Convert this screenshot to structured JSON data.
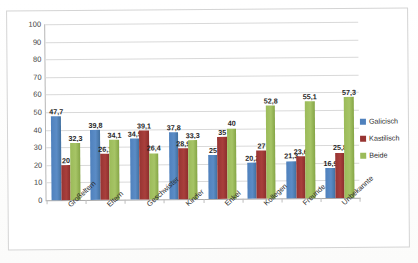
{
  "chart_data": {
    "type": "bar",
    "title": "",
    "subtitle": "",
    "xlabel": "",
    "ylabel": "",
    "ylim": [
      0,
      100
    ],
    "ytick_step": 10,
    "yticks": [
      "100",
      "90",
      "80",
      "70",
      "60",
      "50",
      "40",
      "30",
      "20",
      "10",
      "0"
    ],
    "grid": true,
    "legend_position": "right",
    "categories": [
      "Großeltern",
      "Eltern",
      "Geschwister",
      "Kinder",
      "Enkel",
      "Kollegen",
      "Freunde",
      "Unbekannte"
    ],
    "series": [
      {
        "name": "Galicisch",
        "color": "#4F81BD",
        "values": [
          47.7,
          39.8,
          34.5,
          37.8,
          25,
          20.2,
          21.3,
          16.9
        ],
        "labels": [
          "47,7",
          "39,8",
          "34,5",
          "37,8",
          "25",
          "20,2",
          "21,3",
          "16,9"
        ]
      },
      {
        "name": "Kastilisch",
        "color": "#973432",
        "values": [
          20,
          26.1,
          39.1,
          28.9,
          35,
          27,
          23.6,
          25.8
        ],
        "labels": [
          "20",
          "26,1",
          "39,1",
          "28,9",
          "35",
          "27",
          "23,6",
          "25,8"
        ]
      },
      {
        "name": "Beide",
        "color": "#9BBB59",
        "values": [
          32.3,
          34.1,
          26.4,
          33.3,
          40,
          52.8,
          55.1,
          57.3
        ],
        "labels": [
          "32,3",
          "34,1",
          "26,4",
          "33,3",
          "40",
          "52,8",
          "55,1",
          "57,3"
        ]
      }
    ]
  }
}
